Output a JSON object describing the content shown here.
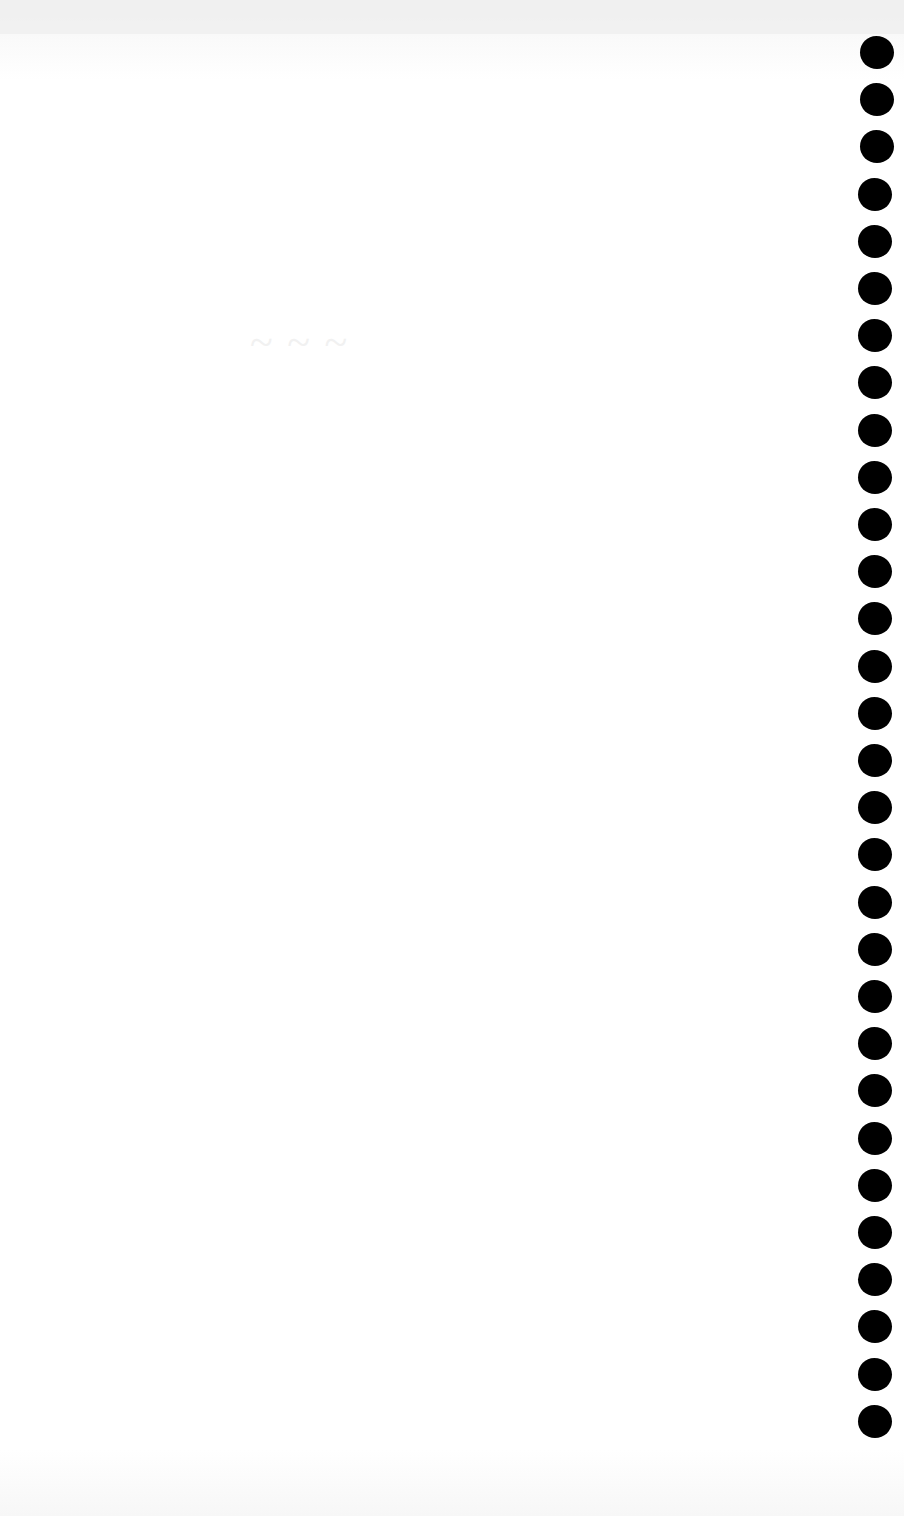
{
  "document": {
    "type": "spiral notebook page (blank)",
    "ghost_text": "~ ~ ~",
    "background_color": "#ffffff",
    "hole_color": "#000000"
  },
  "binding": {
    "hole_count": 30,
    "first_hole_top": 36,
    "spacing": 47.2
  }
}
